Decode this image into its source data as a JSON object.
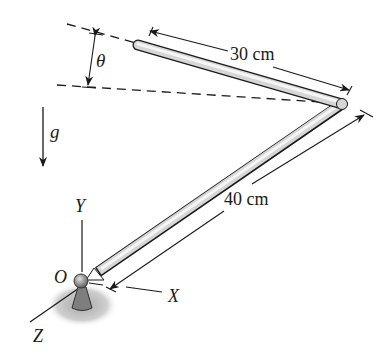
{
  "diagram": {
    "type": "bent-rod-mechanics",
    "labels": {
      "segment_short": "30 cm",
      "segment_long": "40 cm",
      "angle": "θ",
      "gravity": "g",
      "origin": "O",
      "axis_x": "X",
      "axis_y": "Y",
      "axis_z": "Z"
    },
    "colors": {
      "line": "#1a1a1a",
      "rod_fill": "#d9d9d9",
      "rod_highlight": "#f4f4f4",
      "support": "#7a7a7a",
      "shadow": "#bdbdbd"
    }
  }
}
